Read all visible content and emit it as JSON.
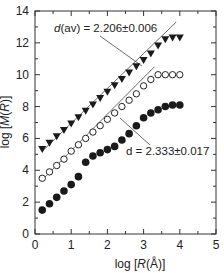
{
  "chart_data": {
    "type": "scatter",
    "title": "",
    "xlabel": "log [R(Å)]",
    "ylabel": "log [M(R)]",
    "xlim": [
      0,
      5
    ],
    "ylim": [
      0,
      14
    ],
    "xticks": [
      0,
      1,
      2,
      3,
      4,
      5
    ],
    "yticks": [
      0,
      2,
      4,
      6,
      8,
      10,
      12,
      14
    ],
    "grid": false,
    "x": [
      0.2,
      0.4,
      0.6,
      0.8,
      1.0,
      1.2,
      1.4,
      1.6,
      1.8,
      2.0,
      2.2,
      2.4,
      2.6,
      2.8,
      3.0,
      3.2,
      3.4,
      3.6,
      3.8,
      4.0
    ],
    "series": [
      {
        "name": "filled triangles",
        "marker": "triangle-down-filled",
        "values": [
          5.3,
          5.7,
          6.1,
          6.5,
          6.9,
          7.3,
          7.7,
          8.1,
          8.5,
          8.9,
          9.3,
          9.7,
          10.1,
          10.5,
          10.9,
          11.3,
          11.8,
          12.2,
          12.3,
          12.3
        ]
      },
      {
        "name": "open circles",
        "marker": "circle-open",
        "values": [
          3.5,
          3.9,
          4.3,
          4.7,
          5.2,
          5.6,
          6.0,
          6.4,
          6.8,
          7.2,
          7.6,
          8.0,
          8.4,
          8.8,
          9.3,
          9.7,
          10.0,
          10.0,
          10.0,
          10.0
        ]
      },
      {
        "name": "filled circles",
        "marker": "circle-filled",
        "values": [
          1.5,
          1.9,
          2.3,
          2.7,
          3.1,
          3.6,
          4.5,
          4.9,
          5.1,
          5.3,
          5.5,
          5.9,
          6.3,
          6.8,
          7.3,
          7.6,
          7.8,
          8.0,
          8.1,
          8.1
        ]
      }
    ],
    "fit_lines": [
      {
        "series": "filled triangles",
        "x": [
          0.2,
          3.9
        ],
        "y": [
          5.2,
          13.3
        ]
      },
      {
        "series": "open circles",
        "x": [
          0.2,
          3.3
        ],
        "y": [
          3.4,
          10.5
        ]
      }
    ],
    "annotations": [
      {
        "text": "d(av) = 2.206 ± 0.006",
        "x": 1.2,
        "y": 12.3,
        "points_to": "filled triangles fit"
      },
      {
        "text": "d = 2.333 ± 0.017",
        "x": 2.2,
        "y": 4.5,
        "points_to": "open circles fit"
      }
    ]
  },
  "labels": {
    "xlabel_prefix": "log [",
    "xlabel_var": "R",
    "xlabel_suffix": "(Å)]",
    "ylabel_prefix": "log [",
    "ylabel_var": "M",
    "ylabel_mid": "(",
    "ylabel_var2": "R",
    "ylabel_suffix": ")]",
    "ann1_var": "d",
    "ann1_rest": "(av) = 2.206±0.006",
    "ann2": "d = 2.333±0.017"
  }
}
